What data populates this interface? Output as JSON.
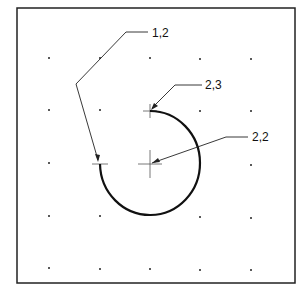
{
  "diagram": {
    "grid": {
      "cols": 5,
      "rows": 5
    },
    "labels": [
      {
        "id": "start",
        "text": "1,2"
      },
      {
        "id": "end",
        "text": "2,3"
      },
      {
        "id": "center",
        "text": "2,2"
      }
    ],
    "arc": {
      "center": "2,2",
      "start": "1,2",
      "end": "2,3",
      "direction": "counterclockwise from start via bottom"
    }
  }
}
